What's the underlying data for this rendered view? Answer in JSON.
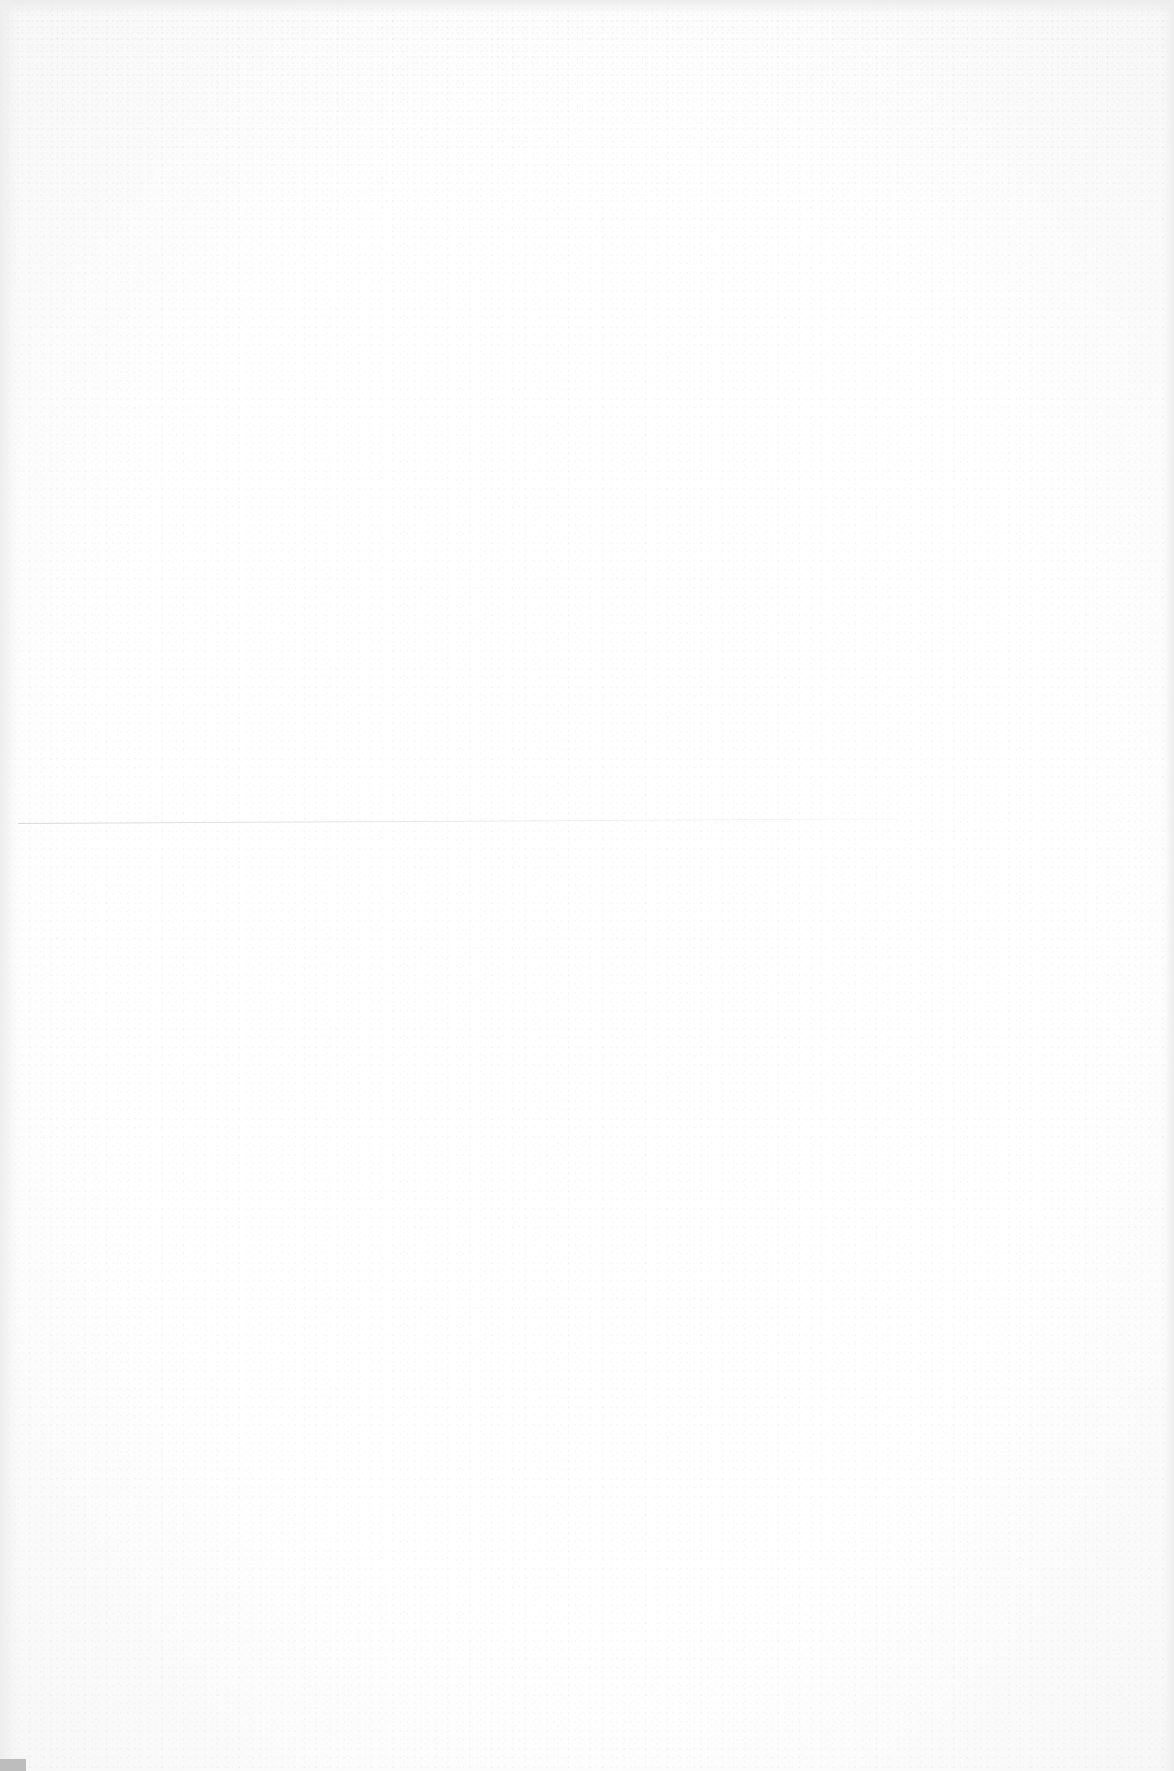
{
  "document": {
    "type": "blank scanned page",
    "text": ""
  },
  "colors": {
    "paper": "#ffffff",
    "edge_shadow": "#ececec",
    "fold_line": "#c8c8c8",
    "corner_mark": "#bdbdbd"
  }
}
